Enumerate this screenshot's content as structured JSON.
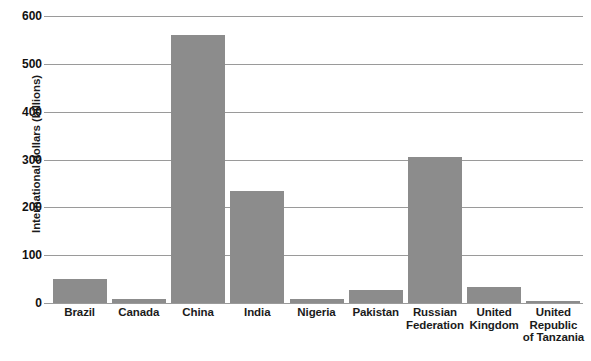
{
  "chart_data": {
    "type": "bar",
    "title": "",
    "xlabel": "",
    "ylabel": "International dollars (billions)",
    "ylim": [
      0,
      600
    ],
    "yticks": [
      0,
      100,
      200,
      300,
      400,
      500,
      600
    ],
    "ytick_labels": [
      "0",
      "100",
      "200",
      "300",
      "400",
      "500",
      "600"
    ],
    "grid": true,
    "legend": "none",
    "bar_color": "#8c8c8c",
    "gridline_color": "#9a9a9a",
    "text_color": "#1b1b1b",
    "categories": [
      "Brazil",
      "Canada",
      "China",
      "India",
      "Nigeria",
      "Pakistan",
      "Russian Federation",
      "United Kingdom",
      "United Republic of Tanzania"
    ],
    "category_lines": [
      [
        "Brazil"
      ],
      [
        "Canada"
      ],
      [
        "China"
      ],
      [
        "India"
      ],
      [
        "Nigeria"
      ],
      [
        "Pakistan"
      ],
      [
        "Russian",
        "Federation"
      ],
      [
        "United",
        "Kingdom"
      ],
      [
        "United",
        "Republic",
        "of Tanzania"
      ]
    ],
    "values": [
      50,
      9,
      560,
      235,
      8,
      28,
      305,
      34,
      4
    ]
  }
}
